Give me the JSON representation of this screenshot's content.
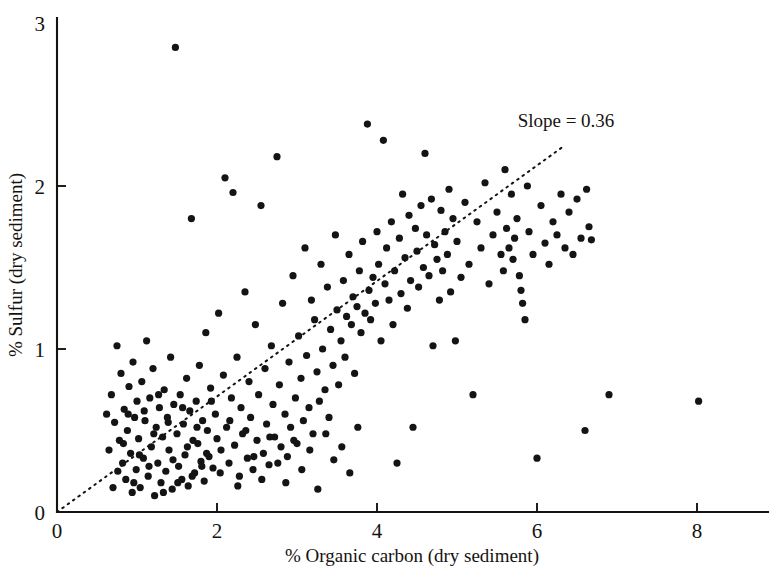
{
  "chart_data": {
    "type": "scatter",
    "title": "",
    "xlabel": "% Organic carbon (dry sediment)",
    "ylabel": "% Sulfur (dry sediment)",
    "xlim": [
      0,
      9
    ],
    "ylim": [
      0,
      3
    ],
    "xticks": [
      0,
      2,
      4,
      6,
      8
    ],
    "yticks": [
      0,
      1,
      2,
      3
    ],
    "xtick_labels": [
      "0",
      "2",
      "4",
      "6",
      "8"
    ],
    "ytick_labels": [
      "0",
      "1",
      "2",
      "3"
    ],
    "grid": false,
    "legend": null,
    "annotations": [
      {
        "text": "Slope = 0.36",
        "x": 6.2,
        "y": 2.45
      }
    ],
    "trend_line": {
      "label": "Slope = 0.36",
      "slope": 0.36,
      "intercept": 0,
      "style": "dotted",
      "x_start": 0.0,
      "x_end": 6.35,
      "y_start": 0.0,
      "y_end": 2.25
    },
    "marker": {
      "shape": "circle",
      "size_px": 3.6,
      "color": "#141414"
    },
    "point_count": 243,
    "points": [
      [
        0.62,
        0.6
      ],
      [
        0.68,
        0.72
      ],
      [
        0.72,
        0.55
      ],
      [
        0.75,
        1.02
      ],
      [
        0.78,
        0.44
      ],
      [
        0.8,
        0.85
      ],
      [
        0.82,
        0.3
      ],
      [
        0.84,
        0.63
      ],
      [
        0.86,
        0.2
      ],
      [
        0.88,
        0.5
      ],
      [
        0.9,
        0.77
      ],
      [
        0.92,
        0.36
      ],
      [
        0.94,
        0.12
      ],
      [
        0.95,
        0.92
      ],
      [
        0.97,
        0.58
      ],
      [
        0.99,
        0.26
      ],
      [
        1.0,
        0.68
      ],
      [
        1.02,
        0.45
      ],
      [
        1.04,
        0.15
      ],
      [
        1.06,
        0.8
      ],
      [
        1.08,
        0.33
      ],
      [
        1.1,
        0.56
      ],
      [
        1.12,
        1.05
      ],
      [
        1.14,
        0.22
      ],
      [
        1.16,
        0.7
      ],
      [
        1.18,
        0.4
      ],
      [
        1.2,
        0.88
      ],
      [
        1.22,
        0.1
      ],
      [
        1.24,
        0.52
      ],
      [
        1.26,
        0.3
      ],
      [
        1.28,
        0.64
      ],
      [
        1.3,
        0.18
      ],
      [
        1.32,
        0.46
      ],
      [
        1.34,
        0.75
      ],
      [
        1.36,
        0.25
      ],
      [
        1.38,
        0.58
      ],
      [
        1.4,
        0.38
      ],
      [
        1.42,
        0.95
      ],
      [
        1.44,
        0.14
      ],
      [
        1.46,
        0.66
      ],
      [
        1.48,
        2.85
      ],
      [
        1.5,
        0.48
      ],
      [
        1.52,
        0.28
      ],
      [
        1.54,
        0.72
      ],
      [
        1.56,
        0.2
      ],
      [
        1.58,
        0.54
      ],
      [
        1.6,
        0.35
      ],
      [
        1.62,
        0.82
      ],
      [
        1.64,
        0.16
      ],
      [
        1.66,
        0.62
      ],
      [
        1.68,
        1.8
      ],
      [
        1.7,
        0.44
      ],
      [
        1.72,
        0.24
      ],
      [
        1.74,
        0.68
      ],
      [
        1.76,
        0.42
      ],
      [
        1.78,
        0.9
      ],
      [
        1.8,
        0.31
      ],
      [
        1.82,
        0.56
      ],
      [
        1.84,
        0.19
      ],
      [
        1.86,
        1.1
      ],
      [
        1.88,
        0.5
      ],
      [
        1.9,
        0.34
      ],
      [
        1.92,
        0.76
      ],
      [
        1.95,
        0.27
      ],
      [
        1.98,
        0.6
      ],
      [
        2.0,
        0.45
      ],
      [
        2.02,
        1.22
      ],
      [
        2.05,
        0.38
      ],
      [
        2.08,
        0.84
      ],
      [
        2.1,
        2.05
      ],
      [
        2.12,
        0.52
      ],
      [
        2.15,
        0.3
      ],
      [
        2.18,
        0.7
      ],
      [
        2.2,
        1.96
      ],
      [
        2.22,
        0.41
      ],
      [
        2.25,
        0.95
      ],
      [
        2.28,
        0.22
      ],
      [
        2.3,
        0.64
      ],
      [
        2.32,
        0.48
      ],
      [
        2.35,
        1.35
      ],
      [
        2.38,
        0.33
      ],
      [
        2.4,
        0.8
      ],
      [
        2.42,
        0.58
      ],
      [
        2.45,
        0.26
      ],
      [
        2.48,
        1.15
      ],
      [
        2.5,
        0.44
      ],
      [
        2.52,
        0.72
      ],
      [
        2.55,
        1.88
      ],
      [
        2.58,
        0.36
      ],
      [
        2.6,
        0.88
      ],
      [
        2.62,
        0.54
      ],
      [
        2.65,
        0.29
      ],
      [
        2.68,
        1.02
      ],
      [
        2.7,
        0.66
      ],
      [
        2.72,
        0.46
      ],
      [
        2.75,
        2.18
      ],
      [
        2.78,
        0.78
      ],
      [
        2.8,
        0.4
      ],
      [
        2.82,
        1.28
      ],
      [
        2.85,
        0.6
      ],
      [
        2.88,
        0.34
      ],
      [
        2.9,
        0.92
      ],
      [
        2.92,
        0.52
      ],
      [
        2.95,
        1.45
      ],
      [
        2.98,
        0.7
      ],
      [
        3.0,
        0.42
      ],
      [
        3.02,
        1.08
      ],
      [
        3.05,
        0.82
      ],
      [
        3.08,
        0.56
      ],
      [
        3.1,
        1.62
      ],
      [
        3.12,
        0.96
      ],
      [
        3.15,
        0.64
      ],
      [
        3.18,
        1.3
      ],
      [
        3.2,
        0.48
      ],
      [
        3.22,
        1.18
      ],
      [
        3.25,
        0.86
      ],
      [
        3.28,
        0.68
      ],
      [
        3.3,
        1.52
      ],
      [
        3.32,
        1.0
      ],
      [
        3.35,
        0.75
      ],
      [
        3.38,
        1.38
      ],
      [
        3.4,
        0.58
      ],
      [
        3.42,
        1.12
      ],
      [
        3.45,
        0.9
      ],
      [
        3.48,
        1.7
      ],
      [
        3.5,
        1.24
      ],
      [
        3.52,
        0.78
      ],
      [
        3.55,
        1.05
      ],
      [
        3.58,
        1.42
      ],
      [
        3.6,
        0.95
      ],
      [
        3.62,
        1.2
      ],
      [
        3.65,
        1.58
      ],
      [
        3.68,
        1.15
      ],
      [
        3.7,
        1.32
      ],
      [
        3.72,
        0.85
      ],
      [
        3.75,
        1.26
      ],
      [
        3.78,
        1.48
      ],
      [
        3.8,
        1.1
      ],
      [
        3.82,
        1.66
      ],
      [
        3.85,
        1.22
      ],
      [
        3.88,
        2.38
      ],
      [
        3.9,
        1.36
      ],
      [
        3.92,
        1.18
      ],
      [
        3.95,
        1.44
      ],
      [
        3.98,
        1.28
      ],
      [
        4.0,
        1.72
      ],
      [
        4.02,
        1.52
      ],
      [
        4.05,
        1.05
      ],
      [
        4.08,
        2.28
      ],
      [
        4.1,
        1.4
      ],
      [
        4.12,
        1.62
      ],
      [
        4.15,
        1.3
      ],
      [
        4.18,
        1.78
      ],
      [
        4.2,
        1.15
      ],
      [
        4.22,
        1.48
      ],
      [
        4.25,
        0.3
      ],
      [
        4.28,
        1.68
      ],
      [
        4.3,
        1.34
      ],
      [
        4.32,
        1.95
      ],
      [
        4.35,
        1.56
      ],
      [
        4.38,
        1.25
      ],
      [
        4.4,
        1.82
      ],
      [
        4.42,
        1.42
      ],
      [
        4.45,
        0.52
      ],
      [
        4.48,
        1.74
      ],
      [
        4.5,
        1.6
      ],
      [
        4.52,
        1.38
      ],
      [
        4.55,
        1.88
      ],
      [
        4.58,
        1.5
      ],
      [
        4.6,
        2.2
      ],
      [
        4.62,
        1.7
      ],
      [
        4.65,
        1.45
      ],
      [
        4.68,
        1.92
      ],
      [
        4.7,
        1.02
      ],
      [
        4.72,
        1.64
      ],
      [
        4.75,
        1.55
      ],
      [
        4.78,
        1.3
      ],
      [
        4.8,
        1.85
      ],
      [
        4.82,
        1.48
      ],
      [
        4.85,
        1.72
      ],
      [
        4.88,
        1.58
      ],
      [
        4.9,
        1.98
      ],
      [
        4.92,
        1.35
      ],
      [
        4.95,
        1.8
      ],
      [
        4.98,
        1.05
      ],
      [
        5.0,
        1.66
      ],
      [
        5.05,
        1.44
      ],
      [
        5.1,
        1.9
      ],
      [
        5.15,
        1.52
      ],
      [
        5.2,
        0.72
      ],
      [
        5.25,
        1.78
      ],
      [
        5.3,
        1.62
      ],
      [
        5.35,
        2.02
      ],
      [
        5.4,
        1.4
      ],
      [
        5.45,
        1.7
      ],
      [
        5.5,
        1.84
      ],
      [
        5.55,
        1.58
      ],
      [
        5.58,
        1.48
      ],
      [
        5.6,
        2.1
      ],
      [
        5.62,
        1.74
      ],
      [
        5.65,
        1.62
      ],
      [
        5.68,
        1.95
      ],
      [
        5.7,
        1.55
      ],
      [
        5.72,
        1.68
      ],
      [
        5.75,
        1.8
      ],
      [
        5.78,
        1.45
      ],
      [
        5.8,
        1.36
      ],
      [
        5.82,
        1.28
      ],
      [
        5.85,
        1.18
      ],
      [
        5.88,
        2.0
      ],
      [
        5.9,
        1.72
      ],
      [
        5.95,
        1.58
      ],
      [
        6.0,
        0.33
      ],
      [
        6.05,
        1.88
      ],
      [
        6.1,
        1.65
      ],
      [
        6.15,
        1.52
      ],
      [
        6.2,
        1.78
      ],
      [
        6.25,
        1.7
      ],
      [
        6.3,
        1.95
      ],
      [
        6.35,
        1.62
      ],
      [
        6.4,
        1.84
      ],
      [
        6.45,
        1.58
      ],
      [
        6.5,
        1.92
      ],
      [
        6.55,
        1.68
      ],
      [
        6.6,
        0.5
      ],
      [
        6.62,
        1.98
      ],
      [
        6.65,
        1.75
      ],
      [
        6.68,
        1.67
      ],
      [
        6.9,
        0.72
      ],
      [
        8.02,
        0.68
      ],
      [
        0.65,
        0.38
      ],
      [
        0.7,
        0.15
      ],
      [
        0.76,
        0.25
      ],
      [
        0.83,
        0.42
      ],
      [
        0.89,
        0.6
      ],
      [
        0.96,
        0.18
      ],
      [
        1.03,
        0.35
      ],
      [
        1.09,
        0.62
      ],
      [
        1.15,
        0.28
      ],
      [
        1.21,
        0.48
      ],
      [
        1.27,
        0.72
      ],
      [
        1.33,
        0.12
      ],
      [
        1.39,
        0.55
      ],
      [
        1.45,
        0.32
      ],
      [
        1.51,
        0.18
      ],
      [
        1.57,
        0.64
      ],
      [
        1.63,
        0.4
      ],
      [
        1.69,
        0.22
      ],
      [
        1.75,
        0.52
      ],
      [
        1.81,
        0.28
      ],
      [
        1.87,
        0.36
      ],
      [
        1.93,
        0.68
      ],
      [
        2.04,
        0.24
      ],
      [
        2.16,
        0.56
      ],
      [
        2.26,
        0.16
      ],
      [
        2.36,
        0.5
      ],
      [
        2.46,
        0.34
      ],
      [
        2.56,
        0.2
      ],
      [
        2.66,
        0.46
      ],
      [
        2.76,
        0.3
      ],
      [
        2.86,
        0.18
      ],
      [
        2.96,
        0.44
      ],
      [
        3.06,
        0.26
      ],
      [
        3.16,
        0.38
      ],
      [
        3.26,
        0.14
      ],
      [
        3.36,
        0.48
      ],
      [
        3.46,
        0.32
      ],
      [
        3.56,
        0.4
      ],
      [
        3.66,
        0.24
      ],
      [
        3.76,
        0.52
      ]
    ]
  },
  "axes": {
    "x_title": "% Organic carbon (dry sediment)",
    "y_title": "% Sulfur (dry sediment)"
  },
  "annotation": {
    "slope_label": "Slope = 0.36"
  },
  "ticks": {
    "x": [
      "0",
      "2",
      "4",
      "6",
      "8"
    ],
    "y": [
      "0",
      "1",
      "2",
      "3"
    ]
  },
  "colors": {
    "ink": "#16130f",
    "marker": "#141414",
    "background": "#ffffff"
  }
}
